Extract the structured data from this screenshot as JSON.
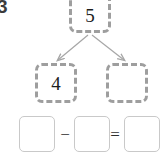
{
  "problem": {
    "number": "3",
    "type": "number-bond-subtraction-worksheet"
  },
  "number_bond": {
    "whole": {
      "label": "5",
      "filled": true,
      "border_style": "dashed",
      "border_color": "#9e9e9e"
    },
    "parts": [
      {
        "label": "4",
        "filled": true,
        "border_style": "dashed",
        "border_color": "#9e9e9e"
      },
      {
        "label": "",
        "filled": false,
        "border_style": "dashed",
        "border_color": "#9e9e9e"
      }
    ],
    "connectors": [
      {
        "name": "arrow-to-left-part",
        "direction": "down-left",
        "color": "#a6a6a6"
      },
      {
        "name": "arrow-to-right-part",
        "direction": "down-right",
        "color": "#a6a6a6"
      }
    ]
  },
  "equation": {
    "boxes": [
      {
        "name": "minuend",
        "value": "",
        "filled": false
      },
      {
        "name": "subtrahend",
        "value": "",
        "filled": false
      },
      {
        "name": "difference",
        "value": "",
        "filled": false
      }
    ],
    "operators": [
      {
        "name": "minus",
        "symbol": "−"
      },
      {
        "name": "equals",
        "symbol": "="
      }
    ],
    "box_border_color": "#c9c9c9"
  },
  "colors": {
    "background": "#ffffff",
    "text": "#1d1d1d",
    "problem_number": "#3b3b3b",
    "dashed_border": "#9e9e9e",
    "solid_border": "#c9c9c9",
    "arrow": "#a6a6a6"
  }
}
